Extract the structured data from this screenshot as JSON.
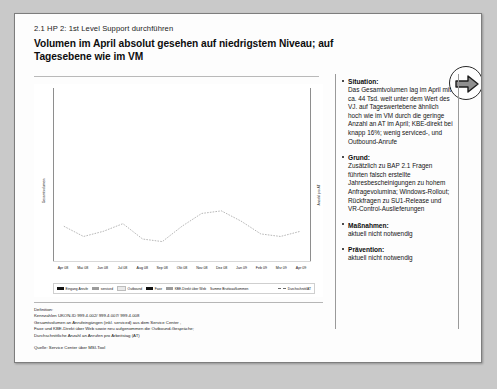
{
  "header": {
    "kicker": "2.1 HP 2: 1st Level Support durchführen",
    "title": "Volumen im April absolut gesehen auf niedrigstem Niveau; auf Tagesebene wie im VM",
    "arrow_icon": "arrow-right-icon"
  },
  "chart_data": {
    "type": "bar",
    "title": "",
    "xlabel": "",
    "ylabel": "Gesamtvolumen",
    "ylabel_right": "Anzahl pro AT",
    "ylim": [
      0,
      100
    ],
    "grid": false,
    "legend_position": "bottom",
    "categories": [
      "Apr 08",
      "Mai 08",
      "Jun 08",
      "Jul 08",
      "Aug 08",
      "Sep 08",
      "Okt 08",
      "Nov 08",
      "Dez 08",
      "Jan 09",
      "Feb 09",
      "Mrz 09",
      "Apr 09"
    ],
    "series": [
      {
        "name": "Eingang Anrufe",
        "values": [
          62,
          50,
          80,
          60,
          58,
          58,
          66,
          72,
          62,
          78,
          53,
          72,
          44
        ]
      },
      {
        "name": "serviced",
        "values": [
          2,
          1,
          2,
          1,
          1,
          1,
          1,
          2,
          1,
          2,
          1,
          2,
          1
        ]
      },
      {
        "name": "Outbound",
        "values": [
          1,
          1,
          1,
          1,
          1,
          1,
          1,
          1,
          1,
          1,
          1,
          1,
          1
        ]
      },
      {
        "name": "Faxe",
        "values": [
          1,
          1,
          1,
          1,
          1,
          1,
          1,
          1,
          1,
          1,
          1,
          1,
          1
        ]
      },
      {
        "name": "KBE-Direkt über Web",
        "values": [
          12,
          10,
          16,
          8,
          7,
          7,
          10,
          13,
          8,
          14,
          10,
          13,
          9
        ]
      }
    ],
    "summe_bruttoaufkommen": [
      78,
      63,
      100,
      71,
      68,
      68,
      79,
      89,
      73,
      96,
      66,
      89,
      56
    ],
    "durchschnitt_at": [
      46,
      42,
      44,
      47,
      41,
      40,
      46,
      51,
      52,
      48,
      43,
      42,
      44
    ],
    "legend": [
      {
        "label": "Eingang Anrufe",
        "color": "#121212",
        "marker": "swatch"
      },
      {
        "label": "serviced",
        "color": "#9b9b9b",
        "marker": "swatch"
      },
      {
        "label": "Outbound",
        "color": "#e9e9e9",
        "marker": "swatch"
      },
      {
        "label": "Faxe",
        "color": "#121212",
        "marker": "swatch"
      },
      {
        "label": "KBE-Direkt über Web",
        "color": "#9b9b9b",
        "marker": "swatch"
      },
      {
        "label": "Summe Bruttoaufkommen",
        "color": "#ffffff",
        "marker": "none"
      },
      {
        "label": "Durchschnitt/AT",
        "color": "#6b6b6b",
        "marker": "dashed-line"
      }
    ]
  },
  "definition": {
    "line1": "Definition:",
    "line2": "Kennzahlen UKON-ID 999.4.002/ 999.4.007/ 999.4.008",
    "line3": "Gesamtvolumen an Anrufeingängen (inkl. serviced) aus dem Service Center ,",
    "line4": "Faxe und KBE-Direkt über Web sowie neu aufgenommen die Outbound-Gespräche;",
    "line5": "Durchschnittliche Anzahl an Anrufen pro Arbeitstag (AT)",
    "quelle": "Quelle: Service Center über MSI-Tool"
  },
  "sidepanel": {
    "blocks": [
      {
        "heading": "Situation:",
        "text": "Das Gesamtvolumen lag im April mit ca. 44 Tsd. weit unter dem Wert des VJ. auf Tageswertebene ähnlich hoch wie im VM durch die geringe Anzahl an AT im April; KBE-direkt bei knapp 16%; wenig serviced-, und Outbound-Anrufe"
      },
      {
        "heading": "Grund:",
        "text": "Zusätzlich zu BAP 2.1 Fragen führten falsch erstellte Jahresbescheinigungen zu hohem Anfragevolumina; Windows-Rollout; Rückfragen zu SU1-Release und VR-Control-Auslieferungen"
      },
      {
        "heading": "Maßnahmen:",
        "text": "aktuell  nicht notwendig"
      },
      {
        "heading": "Prävention:",
        "text": "aktuell  nicht notwendig"
      }
    ]
  }
}
